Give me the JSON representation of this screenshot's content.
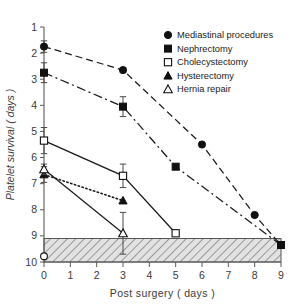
{
  "figure": {
    "background_color": "#ffffff",
    "axis_color": "#5a5a5a",
    "marker_color": "#111111"
  },
  "chart_data": {
    "type": "line",
    "title": "",
    "xlabel": "Post  surgery ( days )",
    "ylabel": "Platelet  survival  ( days )",
    "xlim": [
      0,
      9
    ],
    "ylim": [
      1,
      10
    ],
    "y_inverted": true,
    "grid": false,
    "legend_position": "top-right",
    "x_ticks": [
      0,
      1,
      2,
      3,
      4,
      5,
      6,
      7,
      8,
      9
    ],
    "x_ticklabels": [
      "0",
      "1",
      "2",
      "3",
      "4",
      "5",
      "6",
      "7",
      "8",
      "9"
    ],
    "y_ticks": [
      1,
      2,
      3,
      4,
      5,
      6,
      7,
      8,
      9,
      10
    ],
    "y_ticklabels": [
      "1",
      "2",
      "3",
      "4",
      "5",
      "6",
      "7",
      "8",
      "9",
      "10"
    ],
    "shaded_band": {
      "label": "normal range band",
      "y_from": 9.1,
      "y_to": 10.0,
      "x_from": 0,
      "x_to": 9,
      "pattern": "diagonal-hatch"
    },
    "series": [
      {
        "name": "Mediastinal procedures",
        "marker": "filled-circle",
        "linestyle": "dashed",
        "x": [
          0,
          3,
          6,
          8,
          9
        ],
        "y": [
          1.75,
          2.65,
          5.5,
          8.2,
          9.35
        ],
        "yerr": [
          0.22,
          0.1,
          0,
          0,
          0
        ]
      },
      {
        "name": "Nephrectomy",
        "marker": "filled-square",
        "linestyle": "dash-dot",
        "x": [
          0,
          3,
          5,
          9
        ],
        "y": [
          2.75,
          4.05,
          6.35,
          9.35
        ],
        "yerr": [
          0.38,
          0.38,
          0,
          0
        ]
      },
      {
        "name": "Cholecystectomy",
        "marker": "open-square",
        "linestyle": "solid",
        "x": [
          0,
          3,
          5
        ],
        "y": [
          5.35,
          6.7,
          8.9
        ],
        "yerr": [
          0.5,
          0.45,
          0
        ]
      },
      {
        "name": "Hysterectomy",
        "marker": "filled-triangle",
        "linestyle": "dotted",
        "x": [
          0,
          3
        ],
        "y": [
          6.65,
          7.65
        ],
        "yerr": [
          0.3,
          0
        ]
      },
      {
        "name": "Hernia repair",
        "marker": "open-triangle",
        "linestyle": "solid",
        "x": [
          0,
          3
        ],
        "y": [
          6.45,
          8.9
        ],
        "yerr": [
          0.2,
          0.8
        ]
      }
    ],
    "extra_points": [
      {
        "name": "unlabeled-open-circle",
        "marker": "open-circle",
        "x": 0,
        "y": 9.78
      }
    ]
  },
  "legend": {
    "items": [
      {
        "label": "Mediastinal procedures",
        "marker": "filled-circle"
      },
      {
        "label": "Nephrectomy",
        "marker": "filled-square"
      },
      {
        "label": "Cholecystectomy",
        "marker": "open-square"
      },
      {
        "label": "Hysterectomy",
        "marker": "filled-triangle"
      },
      {
        "label": "Hernia repair",
        "marker": "open-triangle"
      }
    ]
  }
}
